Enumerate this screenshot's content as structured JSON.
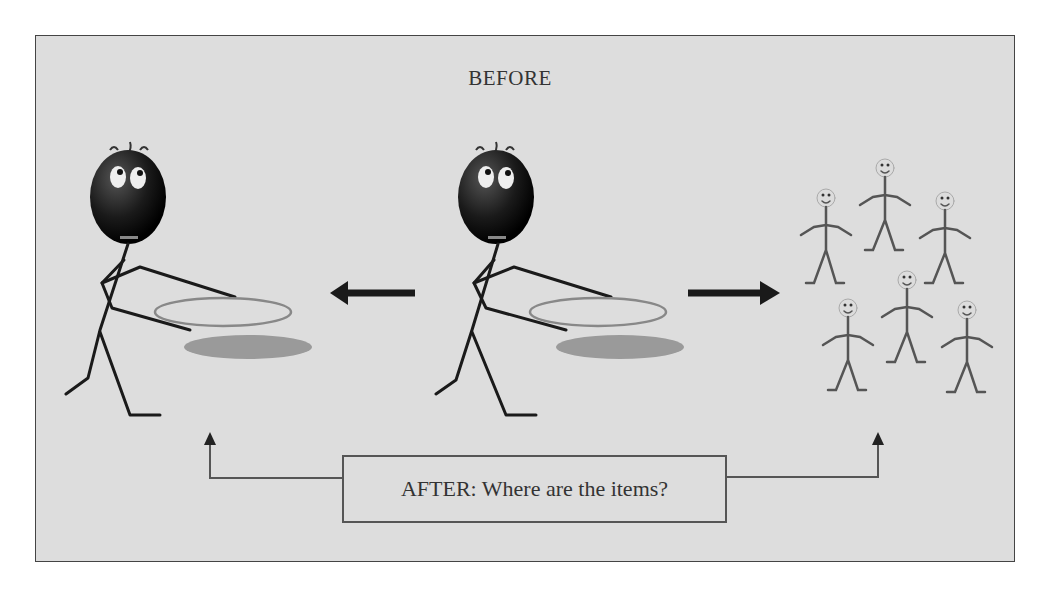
{
  "diagram": {
    "before_label": "BEFORE",
    "after_label": "AFTER: Where are the items?",
    "colors": {
      "page_background": "#ffffff",
      "panel_background": "#dddddd",
      "frame_border": "#444444",
      "figure_dark": "#1a1a1a",
      "plate_outline": "#888888",
      "plate_shadow": "#9a9a9a",
      "small_figure": "#555555"
    },
    "elements": {
      "left_figure": "stick figure with dark round head holding an empty plate",
      "center_figure": "stick figure with dark round head holding an empty plate",
      "left_arrow": "arrow pointing left from center figure toward left figure",
      "right_arrow": "arrow pointing right from center figure toward group of people",
      "people_group": "group of six small smiling stick figures",
      "connector_left": "elbow arrow from AFTER box pointing up under left figure",
      "connector_right": "elbow arrow from AFTER box pointing up under people group"
    },
    "people_group_count": 6
  }
}
